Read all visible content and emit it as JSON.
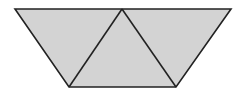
{
  "diagram": {
    "fill_color": "#d3d3d3",
    "stroke_color": "#222222",
    "background_color": "#ffffff",
    "stroke_width": 1.6,
    "vertices": {
      "top_left": [
        15,
        9
      ],
      "top_apex": [
        122,
        9
      ],
      "top_right": [
        231,
        9
      ],
      "bottom_left": [
        69,
        87
      ],
      "bottom_right": [
        176,
        87
      ]
    },
    "triangles": [
      {
        "name": "left-triangle",
        "points": "15,9 122,9 69,87"
      },
      {
        "name": "middle-triangle",
        "points": "122,9 69,87 176,87"
      },
      {
        "name": "right-triangle",
        "points": "122,9 231,9 176,87"
      }
    ],
    "outline": "15,9 231,9 176,87 69,87",
    "inner_edges": [
      {
        "name": "left-diagonal",
        "x1": 122,
        "y1": 9,
        "x2": 69,
        "y2": 87
      },
      {
        "name": "right-diagonal",
        "x1": 122,
        "y1": 9,
        "x2": 176,
        "y2": 87
      }
    ]
  }
}
